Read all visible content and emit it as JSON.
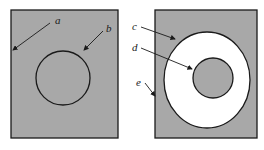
{
  "figure": {
    "left_panel": {
      "labels": {
        "a": "a",
        "b": "b"
      },
      "description": "shaded rectangle with inscribed circle outline"
    },
    "right_panel": {
      "labels": {
        "c": "c",
        "d": "d",
        "e": "e"
      },
      "description": "shaded rectangle containing white annulus with shaded inner disk"
    },
    "colors": {
      "shade": "#a8a8a8",
      "line": "#1a1a1a",
      "background": "#ffffff"
    }
  }
}
